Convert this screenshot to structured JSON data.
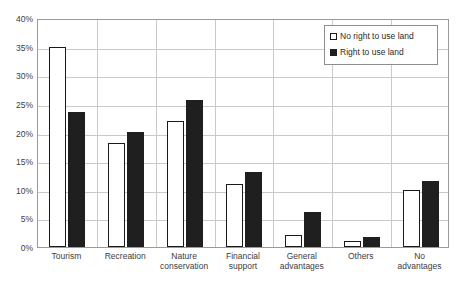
{
  "chart_data": {
    "type": "bar",
    "title": "",
    "xlabel": "",
    "ylabel": "",
    "ylim": [
      0,
      40
    ],
    "ytick_step": 5,
    "ytick_labels": [
      "0%",
      "5%",
      "10%",
      "15%",
      "20%",
      "25%",
      "30%",
      "35%",
      "40%"
    ],
    "grid": true,
    "legend_position": "top-right",
    "categories": [
      "Tourism",
      "Recreation",
      "Nature\nconservation",
      "Financial\nsupport",
      "General\nadvantages",
      "Others",
      "No\nadvantages"
    ],
    "series": [
      {
        "name": "No right to use land",
        "style": "hollow",
        "color": "#ffffff",
        "edge_color": "#1a1a1a",
        "values": [
          35.0,
          18.2,
          22.0,
          11.0,
          2.1,
          1.0,
          10.0
        ]
      },
      {
        "name": "Right to use land",
        "style": "solid",
        "color": "#1f1f1f",
        "edge_color": "#1f1f1f",
        "values": [
          23.6,
          20.1,
          25.7,
          13.1,
          6.1,
          1.8,
          11.5
        ]
      }
    ]
  },
  "legend": {
    "items": [
      {
        "label": "No right to use land",
        "swatch": "hollow-square-icon"
      },
      {
        "label": "Right to use land",
        "swatch": "filled-square-icon"
      }
    ]
  }
}
